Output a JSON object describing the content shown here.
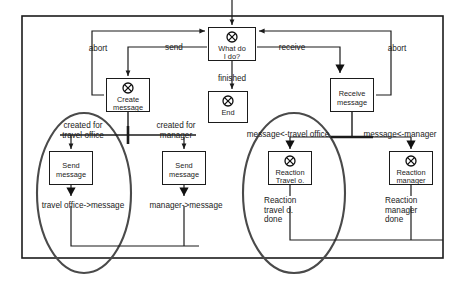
{
  "diagram": {
    "frame": {
      "x": 22,
      "y": 16,
      "width": 421,
      "height": 242
    },
    "colors": {
      "stroke": "#1b1b1b",
      "fill": "#ffffff",
      "highlight": "#4a4a4a",
      "background": "#ffffff"
    },
    "nodes": [
      {
        "id": "what-do-i-do",
        "label_line1": "What do",
        "label_line2": "I do?",
        "icon": "circled-x-icon",
        "has_icon": true,
        "corner_marker": "top-left",
        "x": 208,
        "y": 27,
        "w": 48,
        "h": 34
      },
      {
        "id": "create-message",
        "label_line1": "Create",
        "label_line2": "message",
        "icon": "circled-x-icon",
        "has_icon": true,
        "corner_marker": "none",
        "x": 106,
        "y": 78,
        "w": 44,
        "h": 34
      },
      {
        "id": "end",
        "label_line1": "End",
        "label_line2": "",
        "icon": "circled-x-icon",
        "has_icon": true,
        "corner_marker": "bottom-right",
        "x": 208,
        "y": 91,
        "w": 40,
        "h": 32
      },
      {
        "id": "receive-message",
        "label_line1": "Receive",
        "label_line2": "message",
        "icon": "none",
        "has_icon": false,
        "corner_marker": "none",
        "x": 330,
        "y": 78,
        "w": 44,
        "h": 34
      },
      {
        "id": "send-message-travel-office",
        "label_line1": "Send",
        "label_line2": "message",
        "icon": "none",
        "has_icon": false,
        "corner_marker": "none",
        "x": 49,
        "y": 151,
        "w": 44,
        "h": 34
      },
      {
        "id": "send-message-manager",
        "label_line1": "Send",
        "label_line2": "message",
        "icon": "none",
        "has_icon": false,
        "corner_marker": "none",
        "x": 162,
        "y": 151,
        "w": 44,
        "h": 34
      },
      {
        "id": "reaction-travel-office",
        "label_line1": "Reaction",
        "label_line2": "Travel o.",
        "icon": "circled-x-icon",
        "has_icon": true,
        "corner_marker": "none",
        "x": 268,
        "y": 151,
        "w": 44,
        "h": 34
      },
      {
        "id": "reaction-manager",
        "label_line1": "Reaction",
        "label_line2": "manager",
        "icon": "circled-x-icon",
        "has_icon": true,
        "corner_marker": "none",
        "x": 389,
        "y": 151,
        "w": 44,
        "h": 34
      }
    ],
    "edge_labels": [
      {
        "id": "abort-left",
        "text": "abort",
        "x": 98,
        "y": 44
      },
      {
        "id": "send",
        "text": "send",
        "x": 174,
        "y": 43
      },
      {
        "id": "receive",
        "text": "receive",
        "x": 292,
        "y": 43
      },
      {
        "id": "abort-right",
        "text": "abort",
        "x": 397,
        "y": 44
      },
      {
        "id": "finished",
        "text": "finished",
        "x": 232,
        "y": 74
      },
      {
        "id": "created-for-travel-office",
        "text": "created for\ntravel office",
        "x": 83,
        "y": 122
      },
      {
        "id": "created-for-manager",
        "text": "created for\nmanager",
        "x": 176,
        "y": 122
      },
      {
        "id": "message-from-travel-office",
        "text": "message<-travel office",
        "x": 288,
        "y": 131
      },
      {
        "id": "message-from-manager",
        "text": "message<-manager",
        "x": 400,
        "y": 131
      },
      {
        "id": "travel-office-to-message",
        "text": "travel office->message",
        "x": 83,
        "y": 202
      },
      {
        "id": "manager-to-message",
        "text": "manager->message",
        "x": 186,
        "y": 202
      },
      {
        "id": "reaction-travel-office-done",
        "text": "Reaction\ntravel o.\ndone",
        "x": 264,
        "y": 198
      },
      {
        "id": "reaction-manager-done",
        "text": "Reaction\nmanager\ndone",
        "x": 385,
        "y": 198
      }
    ],
    "highlight_ellipses": [
      {
        "id": "highlight-left",
        "cx": 84,
        "cy": 193,
        "rx": 47,
        "ry": 80
      },
      {
        "id": "highlight-right",
        "cx": 294,
        "cy": 193,
        "rx": 51,
        "ry": 80
      }
    ]
  }
}
